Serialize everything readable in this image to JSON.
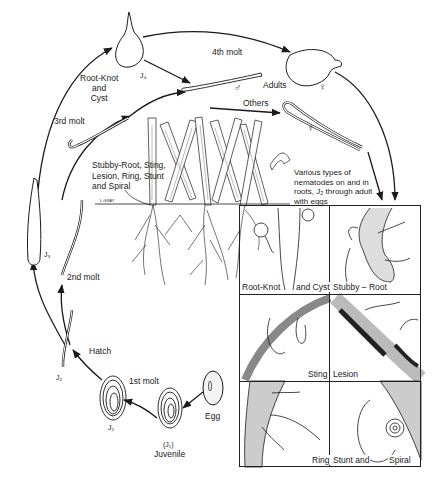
{
  "diagram": {
    "type": "life-cycle",
    "stages": [
      {
        "id": "egg",
        "label": "Egg"
      },
      {
        "id": "j1",
        "label": "(J₁)",
        "sublabel": "Juvenile"
      },
      {
        "id": "j2_in_egg",
        "label": "J₂"
      },
      {
        "id": "j2_hatched",
        "label": "J₂"
      },
      {
        "id": "j3",
        "label": "J₃"
      },
      {
        "id": "j4",
        "label": "J₄"
      },
      {
        "id": "adult_male",
        "label": "♂"
      },
      {
        "id": "adult_female_swollen",
        "label": "♀"
      },
      {
        "id": "adult_female_vermiform",
        "label": "♀"
      }
    ],
    "transitions": [
      {
        "from": "egg",
        "to": "j1",
        "label": ""
      },
      {
        "from": "j1",
        "to": "j2_in_egg",
        "label": "1st molt"
      },
      {
        "from": "j2_in_egg",
        "to": "j2_hatched",
        "label": "Hatch"
      },
      {
        "from": "j2_hatched",
        "to": "j3",
        "label": "2nd molt"
      },
      {
        "from": "j3",
        "to": "j4",
        "label": "3rd molt"
      },
      {
        "from": "j4",
        "to": "adults",
        "label": "4th molt"
      },
      {
        "from": "adults",
        "to": "roots",
        "label": ""
      }
    ]
  },
  "labels": {
    "root_knot_cyst": [
      "Root-Knot",
      "and",
      "Cyst"
    ],
    "j4": "J₄",
    "fourth_molt": "4th molt",
    "male_symbol": "♂",
    "adults": "Adults",
    "female_symbol_top": "♀",
    "others": "Others",
    "female_symbol_mid": "♀",
    "third_molt": "3rd molt",
    "ecto_group": [
      "Stubby-Root, Sting,",
      "Lesion, Ring, Stunt",
      "and Spiral"
    ],
    "soil_line": "L.GRAY",
    "various_types": [
      "Various types of",
      "nematodes on and in",
      "roots, J₂ through adult",
      "with eggs"
    ],
    "j3": "J₃",
    "second_molt": "2nd molt",
    "hatch": "Hatch",
    "j2_hatched": "J₂",
    "first_molt": "1st molt",
    "j2_in_egg": "J₂",
    "j1": "(J₁)",
    "juvenile": "Juvenile",
    "egg": "Egg"
  },
  "panels": [
    {
      "id": "root-knot-cyst",
      "labels": [
        "Root-Knot",
        "and Cyst"
      ]
    },
    {
      "id": "stubby-root",
      "labels": [
        "Stubby – Root"
      ]
    },
    {
      "id": "sting",
      "labels": [
        "Sting"
      ]
    },
    {
      "id": "lesion",
      "labels": [
        "Lesion"
      ]
    },
    {
      "id": "ring",
      "labels": [
        "Ring"
      ]
    },
    {
      "id": "stunt-spiral",
      "labels": [
        "Stunt and",
        "Spiral"
      ]
    }
  ],
  "colors": {
    "ink": "#1a1a1a",
    "background": "#ffffff",
    "root_shade": "#555555"
  }
}
